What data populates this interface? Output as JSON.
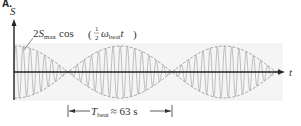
{
  "panel": {
    "label": "A."
  },
  "axes": {
    "y_label": "S",
    "x_label": "t"
  },
  "envelope_label": {
    "coefficient": "2",
    "symbol": "S",
    "subscript": "max",
    "function": "cos",
    "fraction_num": "1",
    "fraction_den": "2",
    "omega": "ω",
    "omega_subscript": "beat",
    "variable": "t"
  },
  "period_bracket": {
    "symbol": "T",
    "subscript": "beat",
    "relation": "≈ 63 s"
  },
  "colors": {
    "wave": "#b0b0b0",
    "envelope": "#a8a8a8",
    "axis": "#333333",
    "background_box": "#f3f3f3"
  },
  "chart_data": {
    "type": "line",
    "xlabel": "t",
    "ylabel": "S",
    "envelope": "2S_max cos(1/2 ω_beat t)",
    "beat_period_s": 63,
    "beats_shown": 2.6
  }
}
